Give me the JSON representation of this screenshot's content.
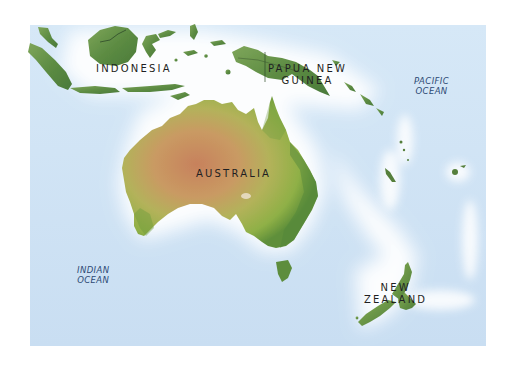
{
  "map": {
    "region": "Australia and Oceania",
    "colors": {
      "ocean": "#cfe3f5",
      "coast_glow": "#ffffff",
      "land_green": "#6f9a4a",
      "land_dark_green": "#3f6e32",
      "desert": "#c98a5a",
      "label_country": "#1f1f22",
      "label_ocean": "#2d4a74"
    },
    "labels": {
      "countries": [
        {
          "id": "indonesia",
          "lines": [
            "INDONESIA"
          ]
        },
        {
          "id": "papua-new-guinea",
          "lines": [
            "PAPUA NEW",
            "GUINEA"
          ]
        },
        {
          "id": "australia",
          "lines": [
            "AUSTRALIA"
          ]
        },
        {
          "id": "new-zealand",
          "lines": [
            "NEW",
            "ZEALAND"
          ]
        }
      ],
      "oceans": [
        {
          "id": "pacific-ocean",
          "lines": [
            "PACIFIC",
            "OCEAN"
          ]
        },
        {
          "id": "indian-ocean",
          "lines": [
            "INDIAN",
            "OCEAN"
          ]
        }
      ]
    }
  }
}
